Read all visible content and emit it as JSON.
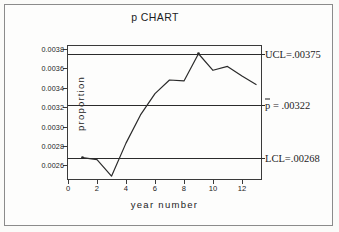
{
  "chart_data": {
    "type": "line",
    "title": "p CHART",
    "xlabel": "year number",
    "ylabel": "proportion",
    "xlim": [
      0,
      13.45
    ],
    "ylim": [
      0.00244,
      0.00383
    ],
    "grid": false,
    "legend": null,
    "x": [
      1,
      2,
      3,
      4,
      5,
      6,
      7,
      8,
      9,
      10,
      11,
      12,
      13
    ],
    "values": [
      0.00268,
      0.00266,
      0.00249,
      0.00283,
      0.00312,
      0.00334,
      0.00348,
      0.00347,
      0.00375,
      0.00358,
      0.00362,
      0.00352,
      0.00343
    ],
    "xticks": [
      0,
      2,
      4,
      6,
      8,
      10,
      12
    ],
    "xtick_labels": [
      "0",
      "2",
      "4",
      "6",
      "8",
      "10",
      "12"
    ],
    "yticks": [
      0.0026,
      0.0028,
      0.003,
      0.0032,
      0.0034,
      0.0036,
      0.0038
    ],
    "ytick_labels": [
      "0.0026",
      "0.0028",
      "0.0030",
      "0.0032",
      "0.0034",
      "0.0036",
      "0.0038"
    ],
    "control_lines": [
      {
        "name": "ucl",
        "value": 0.00375,
        "label": "UCL=.00375"
      },
      {
        "name": "pbar",
        "value": 0.00322,
        "label_prefix": "p",
        "label_suffix": " = .00322"
      },
      {
        "name": "lcl",
        "value": 0.00268,
        "label": "LCL=.00268"
      }
    ],
    "marker_points": [
      1,
      9
    ],
    "line_color": "#2b2b2b",
    "axis_color": "#3a3a3a",
    "background_color": "#fdfdfc"
  }
}
